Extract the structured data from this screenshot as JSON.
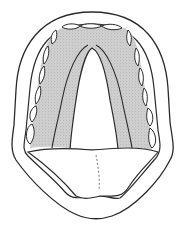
{
  "figure": {
    "style": "line-drawing",
    "colors": {
      "background": "#ffffff",
      "stroke": "#2a2a2a",
      "stipple_fill": "#c8c8c8",
      "stipple_dot": "#8a8a8a",
      "tooth_fill": "#ffffff",
      "tongue_fill": "#ffffff"
    },
    "parts": [
      "outer-lip-outline",
      "inner-mouth-outline",
      "teeth-row",
      "hard-palate-stippled",
      "soft-palate-opening",
      "tongue"
    ]
  }
}
